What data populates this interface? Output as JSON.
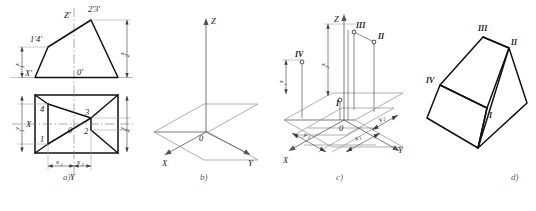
{
  "figure": {
    "background_color": "#ffffff",
    "line_color": "#111111",
    "thin_line_color": "#8c8c8c"
  },
  "panels": [
    {
      "id": "a",
      "caption": "a)",
      "description": "Two-view orthographic drawing: front view (above) and top view (below)",
      "front_view": {
        "labels": [
          {
            "name": "z-prime-axis-label",
            "text": "Z'"
          },
          {
            "name": "point-2-3-prime-label",
            "text": "2'3'"
          },
          {
            "name": "point-1-4-prime-label",
            "text": "1'4'"
          },
          {
            "name": "x-prime-axis-label",
            "text": "X'"
          },
          {
            "name": "origin-prime-label",
            "text": "0'"
          }
        ],
        "dimensions": [
          {
            "name": "dim-z1",
            "text": "z",
            "sub": "1"
          },
          {
            "name": "dim-z2",
            "text": "z",
            "sub": "2"
          }
        ]
      },
      "top_view": {
        "labels": [
          {
            "name": "point-1-label",
            "text": "1"
          },
          {
            "name": "point-2-label",
            "text": "2"
          },
          {
            "name": "point-3-label",
            "text": "3"
          },
          {
            "name": "point-4-label",
            "text": "4"
          },
          {
            "name": "x-axis-label",
            "text": "X"
          },
          {
            "name": "y-axis-label",
            "text": "Y"
          },
          {
            "name": "origin-label",
            "text": "0"
          }
        ],
        "dimensions": [
          {
            "name": "dim-y1",
            "text": "y",
            "sub": "1"
          },
          {
            "name": "dim-y2",
            "text": "y",
            "sub": "2"
          },
          {
            "name": "dim-x1",
            "text": "x",
            "sub": "1"
          },
          {
            "name": "dim-x2",
            "text": "x",
            "sub": "2"
          }
        ]
      }
    },
    {
      "id": "b",
      "caption": "b)",
      "description": "Empty axonometric axes with horizontal reference plane",
      "labels": [
        {
          "name": "z-axis-label",
          "text": "Z"
        },
        {
          "name": "x-axis-label",
          "text": "X"
        },
        {
          "name": "y-axis-label",
          "text": "Y"
        },
        {
          "name": "origin-label",
          "text": "0"
        }
      ]
    },
    {
      "id": "c",
      "caption": "c)",
      "description": "Axonometric plotting of points I, II, III, IV from coordinates",
      "labels": [
        {
          "name": "z-axis-label",
          "text": "Z"
        },
        {
          "name": "x-axis-label",
          "text": "X"
        },
        {
          "name": "y-axis-label",
          "text": "Y"
        },
        {
          "name": "origin-label",
          "text": "0"
        },
        {
          "name": "point-I-label",
          "text": "I"
        },
        {
          "name": "point-II-label",
          "text": "II"
        },
        {
          "name": "point-III-label",
          "text": "III"
        },
        {
          "name": "point-IV-label",
          "text": "IV"
        }
      ],
      "dimensions": [
        {
          "name": "dim-z1",
          "text": "z",
          "sub": "1"
        },
        {
          "name": "dim-z2",
          "text": "z",
          "sub": "2"
        },
        {
          "name": "dim-x1",
          "text": "x",
          "sub": "1"
        },
        {
          "name": "dim-y1",
          "text": "y",
          "sub": "1"
        },
        {
          "name": "dim-y2",
          "text": "y",
          "sub": "2"
        }
      ]
    },
    {
      "id": "d",
      "caption": "d)",
      "description": "Finished axonometric pictorial of the wedge solid",
      "labels": [
        {
          "name": "point-I-label",
          "text": "I"
        },
        {
          "name": "point-II-label",
          "text": "II"
        },
        {
          "name": "point-III-label",
          "text": "III"
        },
        {
          "name": "point-IV-label",
          "text": "IV"
        }
      ]
    }
  ],
  "captions": {
    "a": "a)",
    "b": "b)",
    "c": "c)",
    "d": "d)"
  },
  "footnote": ""
}
